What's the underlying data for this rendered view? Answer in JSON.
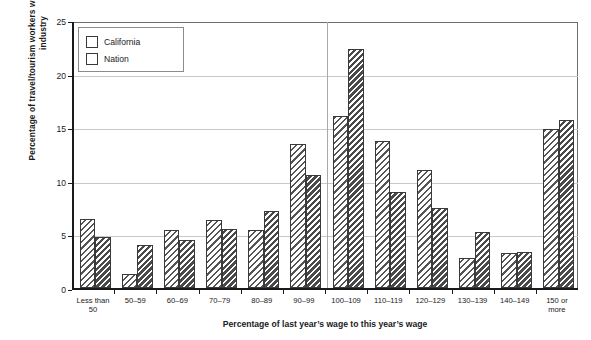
{
  "chart_data": {
    "type": "bar",
    "title": "",
    "xlabel": "Percentage of last year’s wage to this year’s wage",
    "ylabel": "Percentage of travel/tourism workers who moved to a different industry",
    "ylim": [
      0,
      25
    ],
    "yticks": [
      0,
      5,
      10,
      15,
      20,
      25
    ],
    "grid": true,
    "legend_position": "top-left",
    "categories": [
      "Less than\n50",
      "50–59",
      "60–69",
      "70–79",
      "80–89",
      "90–99",
      "100–109",
      "110–119",
      "120–129",
      "130–139",
      "140–149",
      "150 or\nmore"
    ],
    "series": [
      {
        "name": "California",
        "values": [
          6.4,
          1.3,
          5.4,
          6.3,
          5.4,
          13.4,
          16.0,
          13.7,
          11.0,
          2.8,
          3.3,
          14.8
        ]
      },
      {
        "name": "Nation",
        "values": [
          4.8,
          4.0,
          4.5,
          5.5,
          7.2,
          10.5,
          22.3,
          9.0,
          7.5,
          5.2,
          3.4,
          15.7
        ]
      }
    ],
    "colors": {
      "california_hatch": "#555555",
      "nation_hatch": "#4a4a4a",
      "bar_border": "#3a3a3a",
      "gridline": "#c9c9c9",
      "axis": "#1a1a1a",
      "background": "#ffffff"
    },
    "vertical_divider_after_category": "90–99"
  },
  "legend": {
    "items": [
      {
        "label": "California"
      },
      {
        "label": "Nation"
      }
    ]
  },
  "caption": ""
}
